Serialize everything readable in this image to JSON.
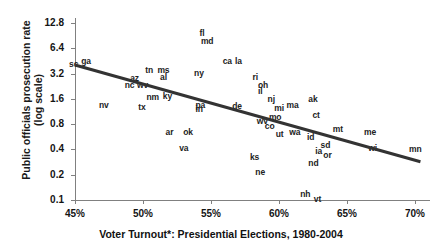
{
  "chart_data": {
    "type": "scatter",
    "title": "",
    "xlabel": "Voter Turnout*: Presidential Elections, 1980-2004",
    "ylabel": "Public officials prosecution rate\n(log scale)",
    "xlim": [
      45,
      71
    ],
    "ylim": [
      0.1,
      12.8
    ],
    "yscale": "log",
    "grid": false,
    "legend": null,
    "xticks": [
      "45%",
      "50%",
      "55%",
      "60%",
      "65%",
      "70%"
    ],
    "xtick_values": [
      45,
      50,
      55,
      60,
      65,
      70
    ],
    "yticks": [
      "12.8",
      "6.4",
      "3.2",
      "1.6",
      "0.8",
      "0.4",
      "0.2",
      "0.1"
    ],
    "ytick_values": [
      12.8,
      6.4,
      3.2,
      1.6,
      0.8,
      0.4,
      0.2,
      0.1
    ],
    "point_label_field": "state",
    "points": [
      {
        "state": "sc",
        "x": 45.0,
        "y": 4.05
      },
      {
        "state": "ga",
        "x": 45.9,
        "y": 4.45
      },
      {
        "state": "nv",
        "x": 47.2,
        "y": 1.3
      },
      {
        "state": "nc",
        "x": 49.1,
        "y": 2.3
      },
      {
        "state": "az",
        "x": 49.5,
        "y": 2.75
      },
      {
        "state": "wv",
        "x": 50.0,
        "y": 2.3
      },
      {
        "state": "tx",
        "x": 50.1,
        "y": 1.25
      },
      {
        "state": "tn",
        "x": 50.6,
        "y": 3.4
      },
      {
        "state": "nm",
        "x": 50.7,
        "y": 1.65
      },
      {
        "state": "ms",
        "x": 51.5,
        "y": 3.4
      },
      {
        "state": "al",
        "x": 51.7,
        "y": 2.85
      },
      {
        "state": "ky",
        "x": 51.9,
        "y": 1.7
      },
      {
        "state": "ar",
        "x": 52.1,
        "y": 0.62
      },
      {
        "state": "ok",
        "x": 53.4,
        "y": 0.62
      },
      {
        "state": "va",
        "x": 53.1,
        "y": 0.41
      },
      {
        "state": "ny",
        "x": 54.2,
        "y": 3.15
      },
      {
        "state": "fl",
        "x": 54.6,
        "y": 9.4
      },
      {
        "state": "md",
        "x": 54.7,
        "y": 7.6
      },
      {
        "state": "pa",
        "x": 54.3,
        "y": 1.32
      },
      {
        "state": "in",
        "x": 54.3,
        "y": 1.18
      },
      {
        "state": "ca",
        "x": 56.3,
        "y": 4.45
      },
      {
        "state": "la",
        "x": 57.2,
        "y": 4.45
      },
      {
        "state": "de",
        "x": 57.0,
        "y": 1.28
      },
      {
        "state": "ks",
        "x": 58.3,
        "y": 0.32
      },
      {
        "state": "ne",
        "x": 58.7,
        "y": 0.21
      },
      {
        "state": "ri",
        "x": 58.5,
        "y": 2.85
      },
      {
        "state": "oh",
        "x": 58.9,
        "y": 2.25
      },
      {
        "state": "il",
        "x": 58.9,
        "y": 1.95
      },
      {
        "state": "wv2",
        "x": 58.8,
        "y": 0.84
      },
      {
        "state": "nj",
        "x": 59.6,
        "y": 1.55
      },
      {
        "state": "co",
        "x": 59.4,
        "y": 0.74
      },
      {
        "state": "mo",
        "x": 59.7,
        "y": 0.95
      },
      {
        "state": "mi",
        "x": 60.1,
        "y": 1.22
      },
      {
        "state": "ma",
        "x": 61.0,
        "y": 1.3
      },
      {
        "state": "ut",
        "x": 60.2,
        "y": 0.6
      },
      {
        "state": "wa",
        "x": 61.2,
        "y": 0.62
      },
      {
        "state": "nh",
        "x": 62.0,
        "y": 0.115
      },
      {
        "state": "vt",
        "x": 63.0,
        "y": 0.1
      },
      {
        "state": "nd",
        "x": 62.6,
        "y": 0.27
      },
      {
        "state": "id",
        "x": 62.5,
        "y": 0.55
      },
      {
        "state": "ia",
        "x": 63.1,
        "y": 0.37
      },
      {
        "state": "sd",
        "x": 63.5,
        "y": 0.44
      },
      {
        "state": "or",
        "x": 63.7,
        "y": 0.33
      },
      {
        "state": "ak",
        "x": 62.6,
        "y": 1.55
      },
      {
        "state": "ct",
        "x": 62.9,
        "y": 1.0
      },
      {
        "state": "mt",
        "x": 64.4,
        "y": 0.68
      },
      {
        "state": "me",
        "x": 66.7,
        "y": 0.63
      },
      {
        "state": "wi",
        "x": 67.0,
        "y": 0.4
      },
      {
        "state": "mn",
        "x": 70.0,
        "y": 0.39
      }
    ],
    "trendline": {
      "type": "linear-on-log",
      "x_start": 45.0,
      "y_start": 4.05,
      "x_end": 70.4,
      "y_end": 0.285,
      "color": "#333333",
      "width_px": 3
    }
  },
  "colors": {
    "axis": "#808080",
    "text": "#141414",
    "point_label": "#222222",
    "trend": "#333333",
    "background": "#ffffff"
  }
}
